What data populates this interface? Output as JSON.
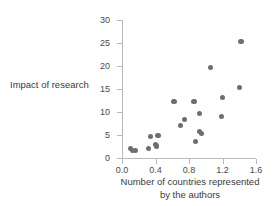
{
  "chart_data": {
    "type": "scatter",
    "title": "",
    "xlabel": "Number of countries represented by the authors",
    "xlabel_line1": "Number of countries represented",
    "xlabel_line2": "by the authors",
    "ylabel": "Impact of research",
    "xlim": [
      0.0,
      1.6
    ],
    "ylim": [
      0,
      30
    ],
    "xticks": [
      0.0,
      0.4,
      0.8,
      1.2,
      1.6
    ],
    "xtick_labels": [
      "0.0",
      "0.4",
      "0.8",
      "1.2",
      "1.6"
    ],
    "yticks": [
      0,
      5,
      10,
      15,
      20,
      25,
      30
    ],
    "ytick_labels": [
      "0",
      "5",
      "10",
      "15",
      "20",
      "25",
      "30"
    ],
    "grid": false,
    "legend": null,
    "marker_color": "#6e6e6e",
    "axis_color": "#b9b9b9",
    "points": [
      {
        "x": 0.1,
        "y": 2.0
      },
      {
        "x": 0.13,
        "y": 1.7
      },
      {
        "x": 0.16,
        "y": 1.6
      },
      {
        "x": 0.32,
        "y": 2.0
      },
      {
        "x": 0.34,
        "y": 4.6
      },
      {
        "x": 0.4,
        "y": 2.9
      },
      {
        "x": 0.41,
        "y": 2.6
      },
      {
        "x": 0.43,
        "y": 4.9
      },
      {
        "x": 0.62,
        "y": 12.2
      },
      {
        "x": 0.7,
        "y": 7.0
      },
      {
        "x": 0.75,
        "y": 8.3
      },
      {
        "x": 0.86,
        "y": 12.3
      },
      {
        "x": 0.88,
        "y": 3.6
      },
      {
        "x": 0.93,
        "y": 9.7
      },
      {
        "x": 0.93,
        "y": 5.8
      },
      {
        "x": 0.95,
        "y": 5.4
      },
      {
        "x": 1.06,
        "y": 19.6
      },
      {
        "x": 1.19,
        "y": 9.0
      },
      {
        "x": 1.2,
        "y": 13.1
      },
      {
        "x": 1.4,
        "y": 15.3
      },
      {
        "x": 1.42,
        "y": 25.3
      }
    ]
  }
}
